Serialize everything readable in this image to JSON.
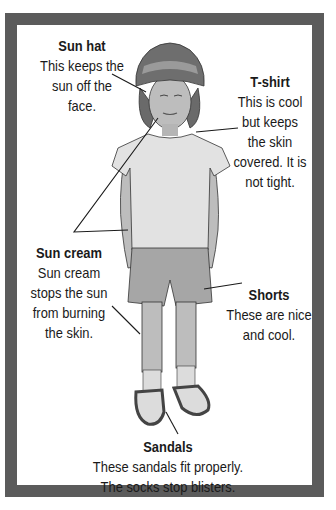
{
  "colors": {
    "frame_border": "#5b5b5b",
    "background": "#ffffff",
    "hat": "#6e6e6e",
    "hat_band": "#9a9a9a",
    "skin": "#b9b9b9",
    "hair": "#6a6a6a",
    "tshirt": "#e2e2e2",
    "shorts": "#a6a6a6",
    "sandals": "#555555",
    "socks": "#dcdcdc",
    "leader_line": "#1a1a1a"
  },
  "labels": {
    "sun_hat": {
      "title": "Sun hat",
      "description": "This keeps the\nsun off the\nface."
    },
    "tshirt": {
      "title": "T-shirt",
      "description": "This is cool\nbut keeps\nthe skin\ncovered. It is\nnot tight."
    },
    "sun_cream": {
      "title": "Sun cream",
      "description": "Sun cream\nstops the sun\nfrom burning\nthe skin."
    },
    "shorts": {
      "title": "Shorts",
      "description": "These are nice\nand cool."
    },
    "sandals": {
      "title": "Sandals",
      "description": "These sandals fit properly.\nThe socks stop blisters."
    }
  }
}
